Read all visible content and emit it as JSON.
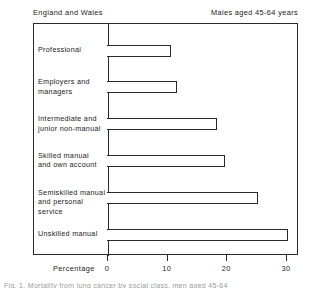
{
  "header": {
    "left": "England and Wales",
    "right": "Males aged 45-64 years"
  },
  "axis": {
    "title": "Percentage",
    "ticks": [
      "0",
      "10",
      "20",
      "30"
    ]
  },
  "caption": {
    "partial": "Fig. 1. Mortality from lung cancer by social class, men aged 45-64"
  },
  "chart_data": {
    "type": "bar",
    "orientation": "horizontal",
    "title": "",
    "subtitle": "",
    "xlabel": "Percentage",
    "ylabel": "",
    "xlim": [
      0,
      32
    ],
    "grid": false,
    "legend": null,
    "bar_style": "open outline, unfilled",
    "categories": [
      "Professional",
      "Employers and\nmanagers",
      "Intermediate and\njunior non-manual",
      "Skilled manual\nand own account",
      "Semiskilled manual\nand personal service",
      "Unskilled manual"
    ],
    "values": [
      10.7,
      11.7,
      18.5,
      19.7,
      25.3,
      30.4
    ],
    "tick_values": [
      0,
      10,
      20,
      30
    ]
  }
}
